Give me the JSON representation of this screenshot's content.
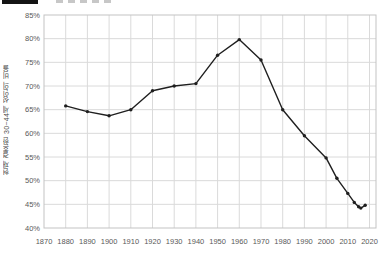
{
  "legend": {
    "swatch_color": "#141414"
  },
  "chart_data": {
    "type": "line",
    "title": "",
    "xlabel": "",
    "ylabel": "현재 결혼한 30~44세 성인의 비율",
    "xlim": [
      1870,
      2023
    ],
    "ylim": [
      40,
      85
    ],
    "grid": true,
    "legend_position": "top-left (cropped)",
    "x_tick_labels": [
      "1870",
      "1880",
      "1890",
      "1900",
      "1910",
      "1920",
      "1930",
      "1940",
      "1950",
      "1960",
      "1970",
      "1980",
      "1990",
      "2000",
      "2010",
      "2020"
    ],
    "y_tick_labels": [
      "85%",
      "80%",
      "75%",
      "70%",
      "65%",
      "60%",
      "55%",
      "50%",
      "45%",
      "40%"
    ],
    "x_ticks": [
      1870,
      1880,
      1890,
      1900,
      1910,
      1920,
      1930,
      1940,
      1950,
      1960,
      1970,
      1980,
      1990,
      2000,
      2010,
      2020
    ],
    "y_ticks": [
      85,
      80,
      75,
      70,
      65,
      60,
      55,
      50,
      45,
      40
    ],
    "line_color": "#1f1f1f",
    "grid_color": "#dadada",
    "frame_color": "#c3c3c3",
    "tick_label_color": "#595959",
    "series": [
      {
        "name": "currently-married-share",
        "points": [
          [
            1880,
            65.8
          ],
          [
            1890,
            64.6
          ],
          [
            1900,
            63.7
          ],
          [
            1910,
            65.0
          ],
          [
            1920,
            69.0
          ],
          [
            1930,
            70.0
          ],
          [
            1940,
            70.5
          ],
          [
            1950,
            76.5
          ],
          [
            1960,
            79.8
          ],
          [
            1970,
            75.5
          ],
          [
            1980,
            65.0
          ],
          [
            1990,
            59.5
          ],
          [
            2000,
            54.8
          ],
          [
            2005,
            50.5
          ],
          [
            2010,
            47.3
          ],
          [
            2013,
            45.4
          ],
          [
            2015,
            44.5
          ],
          [
            2016,
            44.2
          ],
          [
            2018,
            44.8
          ]
        ]
      }
    ]
  }
}
